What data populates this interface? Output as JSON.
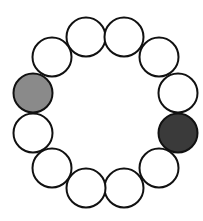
{
  "diagram": {
    "type": "circle-ring",
    "count": 12,
    "radius": 19.5,
    "stroke_color": "#111111",
    "stroke_width": 2,
    "colors": {
      "empty": "#ffffff",
      "gray": "#8a8a8a",
      "dark": "#3a3a3a"
    },
    "circles": [
      {
        "id": 1,
        "cx": 86,
        "cy": 37,
        "fill": "empty"
      },
      {
        "id": 2,
        "cx": 124,
        "cy": 37,
        "fill": "empty"
      },
      {
        "id": 3,
        "cx": 159,
        "cy": 57,
        "fill": "empty"
      },
      {
        "id": 4,
        "cx": 178,
        "cy": 93,
        "fill": "empty"
      },
      {
        "id": 5,
        "cx": 178,
        "cy": 133,
        "fill": "dark"
      },
      {
        "id": 6,
        "cx": 159,
        "cy": 168,
        "fill": "empty"
      },
      {
        "id": 7,
        "cx": 124,
        "cy": 188,
        "fill": "empty"
      },
      {
        "id": 8,
        "cx": 86,
        "cy": 188,
        "fill": "empty"
      },
      {
        "id": 9,
        "cx": 52,
        "cy": 168,
        "fill": "empty"
      },
      {
        "id": 10,
        "cx": 33,
        "cy": 133,
        "fill": "empty"
      },
      {
        "id": 11,
        "cx": 33,
        "cy": 93,
        "fill": "gray"
      },
      {
        "id": 12,
        "cx": 52,
        "cy": 57,
        "fill": "empty"
      }
    ]
  }
}
